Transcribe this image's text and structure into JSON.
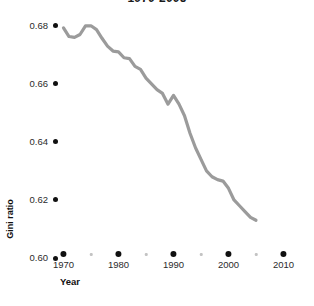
{
  "chart_data": {
    "type": "line",
    "title": "1970-2005",
    "xlabel": "Year",
    "ylabel": "Gini ratio",
    "xlim": [
      1969,
      2011
    ],
    "ylim": [
      0.6,
      0.682
    ],
    "grid": false,
    "legend": null,
    "line_color": "#9b9b9b",
    "axis_color": "#111111",
    "x_ticks": [
      "1970",
      "1980",
      "1990",
      "2000",
      "2010"
    ],
    "x_tick_values": [
      1970,
      1980,
      1990,
      2000,
      2010
    ],
    "x_minor_tick_values": [
      1975,
      1985,
      1995,
      2005
    ],
    "y_ticks": [
      "0.60",
      "0.62",
      "0.64",
      "0.66",
      "0.68"
    ],
    "y_tick_values": [
      0.6,
      0.62,
      0.64,
      0.66,
      0.68
    ],
    "x": [
      1970,
      1971,
      1972,
      1973,
      1974,
      1975,
      1976,
      1977,
      1978,
      1979,
      1980,
      1981,
      1982,
      1983,
      1984,
      1985,
      1986,
      1987,
      1988,
      1989,
      1990,
      1991,
      1992,
      1993,
      1994,
      1995,
      1996,
      1997,
      1998,
      1999,
      2000,
      2001,
      2002,
      2003,
      2004,
      2005
    ],
    "values": [
      0.6793,
      0.6763,
      0.676,
      0.677,
      0.68,
      0.68,
      0.6787,
      0.6757,
      0.673,
      0.6713,
      0.671,
      0.669,
      0.6687,
      0.666,
      0.665,
      0.662,
      0.66,
      0.658,
      0.6567,
      0.653,
      0.656,
      0.653,
      0.649,
      0.643,
      0.638,
      0.634,
      0.63,
      0.628,
      0.627,
      0.6265,
      0.624,
      0.62,
      0.618,
      0.616,
      0.614,
      0.613
    ],
    "series_name": "Gini ratio"
  }
}
